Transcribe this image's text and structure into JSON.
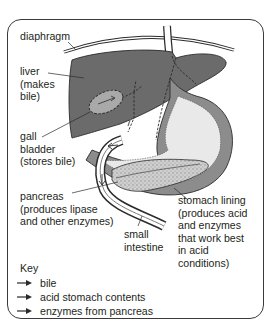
{
  "labels": {
    "diaphragm": "diaphragm",
    "liver": "liver\n(makes\nbile)",
    "gall_bladder": "gall\nbladder\n(stores bile)",
    "pancreas": "pancreas\n(produces lipase\nand other enzymes)",
    "small_intestine": "small\nintestine",
    "stomach_lining": "stomach lining\n(produces acid\nand enzymes\nthat work best\nin acid\nconditions)"
  },
  "key": {
    "title": "Key",
    "items": [
      {
        "label": "bile",
        "arrow_style": "solid-dark",
        "icon": "arrow-right-icon"
      },
      {
        "label": "acid stomach contents",
        "arrow_style": "solid-dark",
        "icon": "arrow-right-icon"
      },
      {
        "label": "enzymes from pancreas",
        "arrow_style": "solid-dark",
        "icon": "arrow-right-icon"
      }
    ]
  },
  "colors": {
    "liver": "#6b6b6b",
    "gall_bladder": "#a9a9a9",
    "stomach_inner": "#e9e9e9",
    "stomach_lining": "#8c8c8c",
    "pancreas": "#c8c8c8",
    "intestine_wall": "#7a7a7a",
    "outline": "#2b2b2b"
  }
}
